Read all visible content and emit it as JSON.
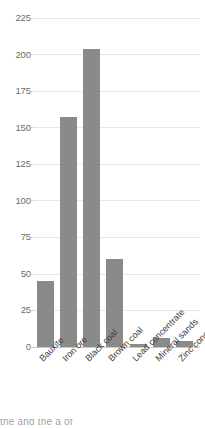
{
  "chart_data": {
    "type": "bar",
    "title": "",
    "subtitle": "",
    "xlabel": "",
    "ylabel": "",
    "categories": [
      "Bauxite",
      "Iron ore",
      "Black coal",
      "Brown coal",
      "Lead concentrate",
      "Mineral sands",
      "Zinc concentrate"
    ],
    "values": [
      45,
      157,
      204,
      60,
      2,
      6,
      4
    ],
    "ylim": [
      0,
      225
    ],
    "yticks": [
      0,
      25,
      50,
      75,
      100,
      125,
      150,
      175,
      200,
      225
    ],
    "ytick_labels": [
      "0",
      "25",
      "50",
      "75",
      "100",
      "125",
      "150",
      "175",
      "200",
      "225"
    ],
    "grid": true,
    "legend": false,
    "legend_position": "none",
    "series": [
      {
        "name": "",
        "values": [
          45,
          157,
          204,
          60,
          2,
          6,
          4
        ]
      }
    ]
  },
  "style": {
    "bar_color": "#8a8a8a",
    "gridline_color": "#e8e8e8",
    "axis_color": "#c9c9c9",
    "ytick_text_color": "#6b6b6b",
    "xtick_text_color": "#3b3b3b",
    "background": "#ffffff"
  },
  "page_sliver": {
    "cut_off_line": "the  and  the  a  of"
  }
}
